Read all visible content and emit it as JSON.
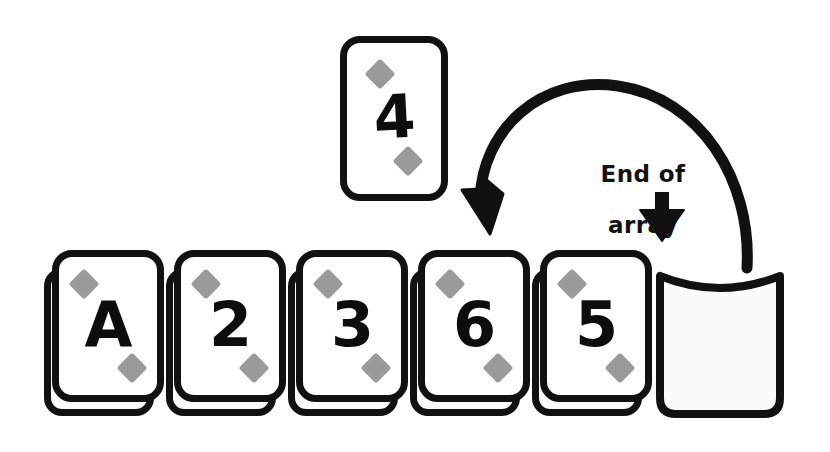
{
  "diagram": {
    "suit_symbol": "diamond",
    "colors": {
      "ink": "#111111",
      "pip_gray": "#9a9a9a",
      "card_face": "#ffffff",
      "slot_fill": "#fbfbfb",
      "background": "#ffffff"
    }
  },
  "floating_card": {
    "rank": "4",
    "suit": "diamond",
    "name": "four-of-diamonds"
  },
  "array": {
    "label": "array-of-cards",
    "cards": [
      {
        "rank": "A",
        "suit": "diamond",
        "name": "ace-of-diamonds"
      },
      {
        "rank": "2",
        "suit": "diamond",
        "name": "two-of-diamonds"
      },
      {
        "rank": "3",
        "suit": "diamond",
        "name": "three-of-diamonds"
      },
      {
        "rank": "6",
        "suit": "diamond",
        "name": "six-of-diamonds"
      },
      {
        "rank": "5",
        "suit": "diamond",
        "name": "five-of-diamonds"
      }
    ],
    "empty_slot": {
      "rank": "",
      "name": "empty-slot",
      "occupied": false
    }
  },
  "annotations": {
    "end_of_array": {
      "line1": "End of",
      "line2": "array",
      "full": "End of array"
    }
  },
  "arrows": {
    "curved_arrow": {
      "name": "insertion-sweep-arrow",
      "from": "end-of-array",
      "to": "six-of-diamonds-position",
      "direction": "right-to-left-over-top"
    },
    "end_of_array_pointer": {
      "name": "end-of-array-pointer-arrow",
      "direction": "down",
      "points_to": "empty-slot"
    }
  }
}
